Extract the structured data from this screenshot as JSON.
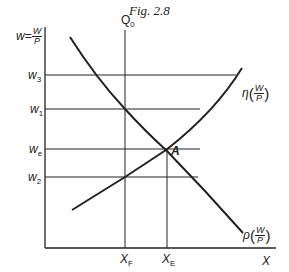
{
  "figure": {
    "caption": "Fig. 2.8",
    "axes": {
      "y_label_var": "w",
      "y_label_eq": "=",
      "y_label_num": "W",
      "y_label_den": "P",
      "x_label": "X"
    },
    "vertical_line_label": "Q",
    "vertical_line_sub": "0",
    "wage_levels": [
      {
        "label": "w",
        "sub": "3"
      },
      {
        "label": "w",
        "sub": "1"
      },
      {
        "label": "w",
        "sub": "e"
      },
      {
        "label": "w",
        "sub": "2"
      }
    ],
    "x_markers": [
      {
        "label": "X",
        "sub": "F"
      },
      {
        "label": "X",
        "sub": "E"
      }
    ],
    "intersection_label": "A",
    "curves": {
      "upward": {
        "symbol": "η",
        "num": "W",
        "den": "P"
      },
      "downward": {
        "symbol": "ρ",
        "num": "W",
        "den": "P"
      }
    },
    "colors": {
      "ink": "#222222",
      "background": "#ffffff"
    }
  }
}
